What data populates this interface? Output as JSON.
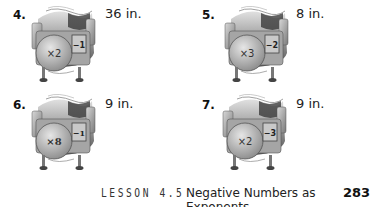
{
  "problems": [
    {
      "number": "4.",
      "multiplier": "×2",
      "exponent": "−1",
      "length": "36 in."
    },
    {
      "number": "5.",
      "multiplier": "×3",
      "exponent": "−2",
      "length": "8 in."
    },
    {
      "number": "6.",
      "multiplier": "×8",
      "exponent": "−1",
      "length": "9 in."
    },
    {
      "number": "7.",
      "multiplier": "×2",
      "exponent": "−3",
      "length": "9 in."
    }
  ],
  "footer": {
    "lesson": "LESSON 4.5",
    "title": "Negative Numbers as Exponents",
    "page_number": "283"
  },
  "colors": {
    "machine_body": "#9a9a9a",
    "machine_dark": "#4a4a4a",
    "machine_light": "#d6d6d6",
    "text": "#111111"
  }
}
